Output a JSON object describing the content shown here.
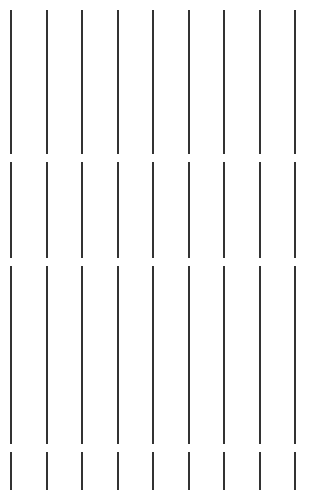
{
  "page": {
    "width": 316,
    "height": 497,
    "background_color": "#ffffff"
  },
  "rules": {
    "description": "Nine evenly spaced vertical dark rules, each broken into four segments by three horizontal gaps",
    "line_color": "#333333",
    "line_width": 2,
    "column_count": 9,
    "segment_count_per_column": 4,
    "gap_count_per_column": 3,
    "column_spacing": 35.5,
    "column_x_positions": [
      10,
      45.5,
      81,
      116.5,
      152,
      187.5,
      223,
      258.5,
      294
    ],
    "segments": [
      {
        "name": "segment-top",
        "top": 10,
        "height": 144
      },
      {
        "name": "segment-upper-middle",
        "top": 162,
        "height": 96
      },
      {
        "name": "segment-lower-middle",
        "top": 266,
        "height": 178
      },
      {
        "name": "segment-bottom",
        "top": 452,
        "height": 38
      }
    ],
    "gaps": [
      {
        "name": "gap-1",
        "top": 154,
        "height": 8
      },
      {
        "name": "gap-2",
        "top": 258,
        "height": 8
      },
      {
        "name": "gap-3",
        "top": 444,
        "height": 8
      }
    ]
  }
}
